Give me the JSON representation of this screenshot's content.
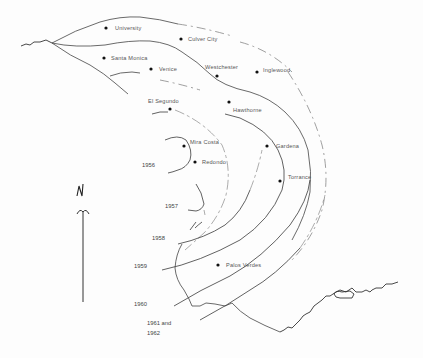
{
  "map": {
    "north_label": "N",
    "places": [
      {
        "name": "University",
        "dot": [
          106,
          28
        ],
        "label": [
          115,
          30
        ]
      },
      {
        "name": "Culver City",
        "dot": [
          181,
          39
        ],
        "label": [
          188,
          41
        ]
      },
      {
        "name": "Santa Monica",
        "dot": [
          104,
          58
        ],
        "label": [
          111,
          60
        ]
      },
      {
        "name": "Venice",
        "dot": [
          151,
          69
        ],
        "label": [
          159,
          71
        ]
      },
      {
        "name": "Westchester",
        "dot": [
          217,
          76
        ],
        "label": [
          205,
          69
        ]
      },
      {
        "name": "Inglewood",
        "dot": [
          257,
          72
        ],
        "label": [
          263,
          72
        ]
      },
      {
        "name": "El Segundo",
        "dot": [
          170,
          109
        ],
        "label": [
          148,
          103
        ]
      },
      {
        "name": "Hawthorne",
        "dot": [
          229,
          102
        ],
        "label": [
          233,
          112
        ]
      },
      {
        "name": "Mira Costa",
        "dot": [
          184,
          146
        ],
        "label": [
          190,
          144
        ]
      },
      {
        "name": "Redondo",
        "dot": [
          195,
          162
        ],
        "label": [
          202,
          164
        ]
      },
      {
        "name": "Gardena",
        "dot": [
          267,
          146
        ],
        "label": [
          276,
          148
        ]
      },
      {
        "name": "Torrance",
        "dot": [
          280,
          181
        ],
        "label": [
          288,
          179
        ]
      },
      {
        "name": "Palos Verdes",
        "dot": [
          218,
          265
        ],
        "label": [
          226,
          267
        ]
      }
    ],
    "years": [
      {
        "label": "1956",
        "pos": [
          142,
          167
        ]
      },
      {
        "label": "1957",
        "pos": [
          165,
          208
        ]
      },
      {
        "label": "1958",
        "pos": [
          152,
          240
        ]
      },
      {
        "label": "1959",
        "pos": [
          134,
          268
        ]
      },
      {
        "label": "1960",
        "pos": [
          134,
          306
        ]
      },
      {
        "label": "1961 and",
        "pos": [
          147,
          325
        ]
      },
      {
        "label": "1962",
        "pos": [
          147,
          335
        ]
      }
    ]
  }
}
